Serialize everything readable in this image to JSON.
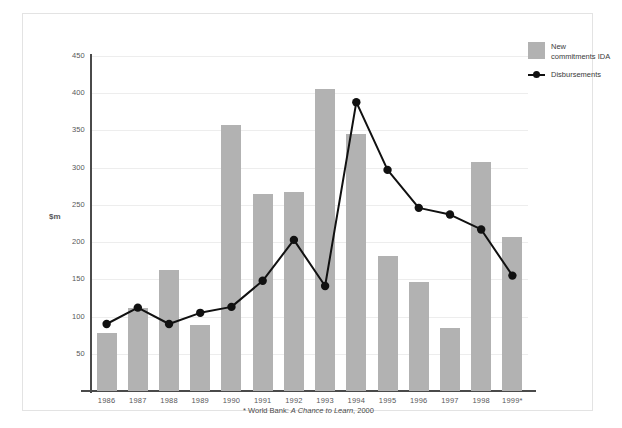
{
  "chart_data": {
    "type": "bar",
    "title": "",
    "subtitle": "",
    "xlabel": "",
    "ylabel": "$m",
    "ylim": [
      0,
      450
    ],
    "yticks": [
      0,
      50,
      100,
      150,
      200,
      250,
      300,
      350,
      400,
      450
    ],
    "ytick_labels": [
      "0",
      "50",
      "100",
      "150",
      "200",
      "250",
      "300",
      "350",
      "400",
      "450"
    ],
    "grid": true,
    "legend_position": "top-right",
    "categories": [
      "1986",
      "1987",
      "1988",
      "1989",
      "1990",
      "1991",
      "1992",
      "1993",
      "1994",
      "1995",
      "1996",
      "1997",
      "1998",
      "1999*"
    ],
    "series": [
      {
        "name": "New commitments IDA",
        "type": "bar",
        "color": "#b2b2b2",
        "values": [
          78,
          111,
          162,
          89,
          357,
          265,
          268,
          406,
          345,
          182,
          147,
          85,
          307,
          207
        ]
      },
      {
        "name": "Disbursements",
        "type": "line",
        "color": "#111111",
        "marker": "circle",
        "values": [
          90,
          112,
          90,
          105,
          113,
          148,
          203,
          141,
          388,
          297,
          246,
          237,
          217,
          155
        ]
      }
    ],
    "annotations": [
      "* World Bank: A Chance to Learn, 2000"
    ]
  },
  "legend": {
    "bars_label": "New commitments IDA",
    "line_label": "Disbursements",
    "bars_color": "#b2b2b2",
    "line_color": "#111111"
  },
  "axes": {
    "y_label": "$m",
    "y_ticks": [
      "450",
      "400",
      "350",
      "300",
      "250",
      "200",
      "150",
      "100",
      "50"
    ],
    "x_ticks": [
      "1986",
      "1987",
      "1988",
      "1989",
      "1990",
      "1991",
      "1992",
      "1993",
      "1994",
      "1995",
      "1996",
      "1997",
      "1998",
      "1999*"
    ]
  },
  "footnote": {
    "marker": "* ",
    "prefix": "World Bank: ",
    "source_title": "A Chance to Learn",
    "suffix": ", 2000"
  },
  "colors": {
    "bar_fill": "#b2b2b2",
    "line": "#111111",
    "grid": "#ededed",
    "axis": "#4a4a4a",
    "frame": "#e3e3e3",
    "text": "#58585a",
    "background": "#ffffff"
  }
}
